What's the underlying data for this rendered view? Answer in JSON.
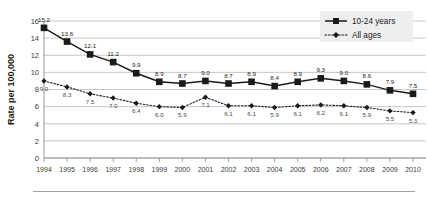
{
  "chart_data": {
    "type": "line",
    "title": "",
    "xlabel": "",
    "ylabel": "Rate per 100,000",
    "ylim": [
      0,
      16
    ],
    "ytick_values": [
      0,
      2,
      4,
      6,
      8,
      10,
      12,
      14,
      16
    ],
    "grid": true,
    "legend_position": "top-right",
    "categories": [
      "1994",
      "1995",
      "1996",
      "1997",
      "1998",
      "1999",
      "2000",
      "2001",
      "2002",
      "2003",
      "2004",
      "2005",
      "2006",
      "2007",
      "2008",
      "2009",
      "2010"
    ],
    "series": [
      {
        "name": "10-24 years",
        "marker": "square",
        "line_style": "solid",
        "color": "#1a1a1a",
        "values": [
          15.2,
          13.6,
          12.1,
          11.2,
          9.9,
          8.9,
          8.7,
          9.0,
          8.7,
          8.9,
          8.4,
          8.9,
          9.3,
          9.0,
          8.6,
          7.9,
          7.5
        ]
      },
      {
        "name": "All ages",
        "marker": "diamond",
        "line_style": "dotted",
        "color": "#1a1a1a",
        "values": [
          9.0,
          8.3,
          7.5,
          7.0,
          6.4,
          6.0,
          5.9,
          7.1,
          6.1,
          6.1,
          5.9,
          6.1,
          6.2,
          6.1,
          5.9,
          5.5,
          5.3
        ]
      }
    ]
  },
  "legend": {
    "items": [
      {
        "label": "10-24 years"
      },
      {
        "label": "All ages"
      }
    ],
    "background": "#eeeeee"
  },
  "colors": {
    "grid": "#b9b9b9",
    "axis": "#8c8c8c",
    "ink": "#1a1a1a",
    "rule": "#9a9a9a"
  }
}
